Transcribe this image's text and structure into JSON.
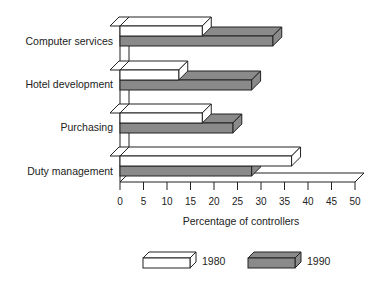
{
  "chart_data": {
    "type": "bar",
    "orientation": "horizontal",
    "style": "3d",
    "title": "",
    "xlabel": "Percentage of controllers",
    "ylabel": "",
    "xlim": [
      0,
      50
    ],
    "x_ticks": [
      0,
      5,
      10,
      15,
      20,
      25,
      30,
      35,
      40,
      45,
      50
    ],
    "grid": false,
    "legend_position": "bottom",
    "categories": [
      "Computer services",
      "Hotel development",
      "Purchasing",
      "Duty management"
    ],
    "series": [
      {
        "name": "1980",
        "color": "#ffffff",
        "values": [
          17.5,
          12.5,
          17.5,
          36.5
        ]
      },
      {
        "name": "1990",
        "color": "#8a8a8a",
        "values": [
          32.5,
          28,
          24,
          28
        ]
      }
    ]
  },
  "legend": {
    "items": [
      {
        "label": "1980",
        "color": "#ffffff"
      },
      {
        "label": "1990",
        "color": "#8a8a8a"
      }
    ]
  }
}
